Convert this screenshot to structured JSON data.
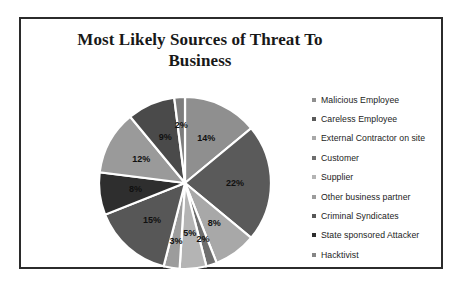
{
  "frame": {
    "border_color": "#2b2b2b",
    "background": "#ffffff"
  },
  "title": "Most Likely Sources of Threat To Business",
  "legend": {
    "position": "right",
    "items": [
      {
        "label": "Malicious Employee",
        "marker": "square-marker",
        "color": "#8f8f8f"
      },
      {
        "label": "Careless Employee",
        "marker": "square-marker",
        "color": "#5a5a5a"
      },
      {
        "label": "External Contractor on site",
        "marker": "square-marker",
        "color": "#a8a8a8"
      },
      {
        "label": "Customer",
        "marker": "square-marker",
        "color": "#6e6e6e"
      },
      {
        "label": "Supplier",
        "marker": "square-marker",
        "color": "#b4b4b4"
      },
      {
        "label": "Other business partner",
        "marker": "square-marker",
        "color": "#9c9c9c"
      },
      {
        "label": "Criminal Syndicates",
        "marker": "square-marker",
        "color": "#575757"
      },
      {
        "label": "State sponsored Attacker",
        "marker": "square-marker",
        "color": "#2e2e2e"
      },
      {
        "label": "Hacktivist",
        "marker": "square-marker",
        "color": "#868686"
      }
    ]
  },
  "chart_data": {
    "type": "pie",
    "title": "Most Likely Sources of Threat To Business",
    "xlabel": "",
    "ylabel": "",
    "start_angle_deg": 0,
    "direction": "clockwise",
    "categories": [
      "Malicious Employee",
      "Careless Employee",
      "External Contractor on site",
      "Customer",
      "Supplier",
      "Other business partner",
      "Criminal Syndicates",
      "State sponsored Attacker",
      "Hacktivist"
    ],
    "values": [
      14,
      22,
      8,
      2,
      5,
      3,
      15,
      8,
      12
    ],
    "data_labels": [
      "14%",
      "22%",
      "8%",
      "2%",
      "5%",
      "3%",
      "15%",
      "8%",
      "12%"
    ],
    "extra_slices": [
      {
        "label": "9%",
        "value": 9
      },
      {
        "label": "2%",
        "value": 2
      }
    ],
    "slices": [
      {
        "label": "14%",
        "value": 14,
        "color": "#8f8f8f"
      },
      {
        "label": "22%",
        "value": 22,
        "color": "#5a5a5a"
      },
      {
        "label": "8%",
        "value": 8,
        "color": "#a8a8a8"
      },
      {
        "label": "2%",
        "value": 2,
        "color": "#6e6e6e"
      },
      {
        "label": "5%",
        "value": 5,
        "color": "#b4b4b4"
      },
      {
        "label": "3%",
        "value": 3,
        "color": "#9c9c9c"
      },
      {
        "label": "15%",
        "value": 15,
        "color": "#575757"
      },
      {
        "label": "8%",
        "value": 8,
        "color": "#2e2e2e"
      },
      {
        "label": "12%",
        "value": 12,
        "color": "#9a9a9a"
      },
      {
        "label": "9%",
        "value": 9,
        "color": "#4a4a4a"
      },
      {
        "label": "2%",
        "value": 2,
        "color": "#7d7d7d"
      }
    ],
    "legend_position": "right",
    "grid": false,
    "separator_color": "#ffffff"
  }
}
